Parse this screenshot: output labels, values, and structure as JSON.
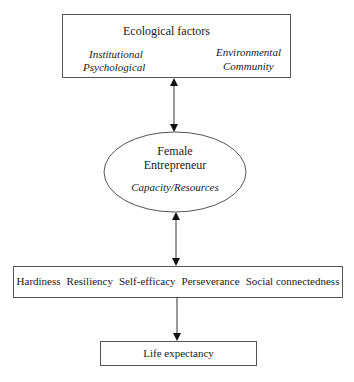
{
  "ecological": {
    "title": "Ecological factors",
    "left": [
      "Institutional",
      "Psychological"
    ],
    "right": [
      "Environmental",
      "Community"
    ]
  },
  "entrepreneur": {
    "line1": "Female",
    "line2": "Entrepreneur",
    "subtitle": "Capacity/Resources"
  },
  "traits": [
    "Hardiness",
    "Resiliency",
    "Self-efficacy",
    "Perseverance",
    "Social connectedness"
  ],
  "outcome": "Life expectancy",
  "connectors": [
    {
      "from": "ecological-factors",
      "to": "female-entrepreneur",
      "type": "bidirectional"
    },
    {
      "from": "female-entrepreneur",
      "to": "traits",
      "type": "bidirectional"
    },
    {
      "from": "traits",
      "to": "life-expectancy",
      "type": "directed"
    }
  ]
}
